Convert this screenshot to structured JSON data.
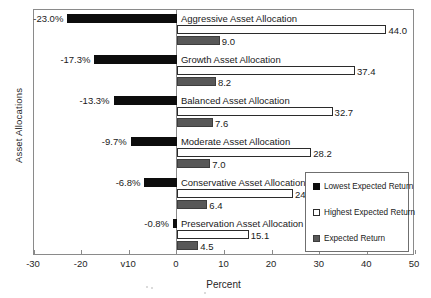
{
  "chart_data": {
    "type": "bar",
    "orientation": "horizontal",
    "title": "",
    "xlabel": "Percent",
    "ylabel": "Asset Allocations",
    "xlim": [
      -30,
      50
    ],
    "xticks": [
      -30,
      -20,
      -10,
      0,
      10,
      20,
      30,
      40,
      50
    ],
    "xticklabels": [
      "-30",
      "-20",
      "v10",
      "0",
      "10",
      "20",
      "30",
      "40",
      "50"
    ],
    "grid": false,
    "legend_position": "center-right",
    "categories": [
      "Aggressive Asset Allocation",
      "Growth Asset Allocation",
      "Balanced Asset Allocation",
      "Moderate Asset Allocation",
      "Conservative Asset Allocation",
      "Preservation Asset Allocation"
    ],
    "series": [
      {
        "name": "Lowest Expected Return",
        "color": "#0d0d0d",
        "values": [
          -23.0,
          -17.3,
          -13.3,
          -9.7,
          -6.8,
          -0.8
        ],
        "labels": [
          "-23.0%",
          "-17.3%",
          "-13.3%",
          "-9.7%",
          "-6.8%",
          "-0.8%"
        ]
      },
      {
        "name": "Highest Expected Return",
        "color": "#ffffff",
        "values": [
          44.0,
          37.4,
          32.7,
          28.2,
          24.4,
          15.1
        ],
        "labels": [
          "44.0",
          "37.4",
          "32.7",
          "28.2",
          "24.4",
          "15.1"
        ]
      },
      {
        "name": "Expected Return",
        "color": "#585858",
        "values": [
          9.0,
          8.2,
          7.6,
          7.0,
          6.4,
          4.5
        ],
        "labels": [
          "9.0",
          "8.2",
          "7.6",
          "7.0",
          "6.4",
          "4.5"
        ]
      }
    ]
  },
  "legend": {
    "items": [
      {
        "label": "Lowest Expected Return",
        "swatch": "sw-lowest"
      },
      {
        "label": "Highest Expected Return",
        "swatch": "sw-highest"
      },
      {
        "label": "Expected Return",
        "swatch": "sw-expected"
      }
    ]
  }
}
